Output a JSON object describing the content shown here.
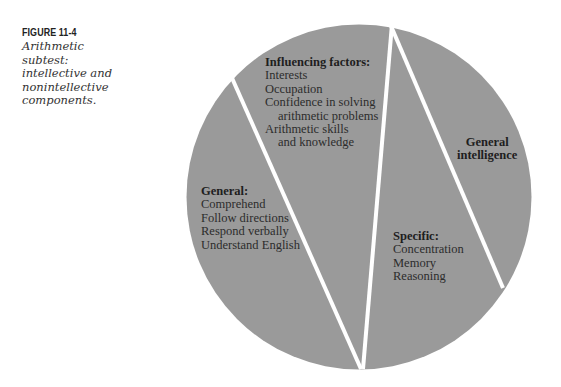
{
  "caption": {
    "figure_label": "FIGURE 11-4",
    "text": "Arithmetic subtest: intellective and nonintellective components.",
    "lines": [
      "Arithmetic",
      "subtest:",
      "intellective and",
      "nonintellective",
      "components."
    ]
  },
  "diagram": {
    "type": "segmented-circle",
    "fill_color": "#9a9a9a",
    "divider_color": "#ffffff",
    "segments": [
      {
        "id": "general",
        "heading": "General:",
        "items": [
          "Comprehend",
          "Follow directions",
          "Respond verbally",
          "Understand English"
        ]
      },
      {
        "id": "influencing-factors",
        "heading": "Influencing factors:",
        "items": [
          "Interests",
          "Occupation",
          "Confidence in solving",
          "arithmetic problems",
          "Arithmetic skills",
          "and knowledge"
        ]
      },
      {
        "id": "specific",
        "heading": "Specific:",
        "items": [
          "Concentration",
          "Memory",
          "Reasoning"
        ]
      },
      {
        "id": "general-intelligence",
        "heading_lines": [
          "General",
          "intelligence"
        ]
      }
    ]
  }
}
